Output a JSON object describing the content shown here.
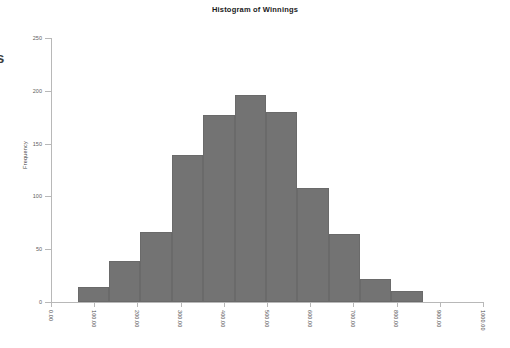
{
  "edge_fragment": {
    "text": "s"
  },
  "chart_data": {
    "type": "bar",
    "title": "Histogram of Winnings",
    "subtitle": "",
    "xlabel": "",
    "ylabel": "Frequency",
    "grid": false,
    "legend": "none",
    "bar_color": "#737373",
    "bar_edge_color": "#6a6a6a",
    "axis_color": "#b8b8b8",
    "xlim": [
      0,
      1000
    ],
    "ylim": [
      0,
      250
    ],
    "x_tick_labels": [
      "0.00",
      "100.00",
      "200.00",
      "300.00",
      "400.00",
      "500.00",
      "600.00",
      "700.00",
      "800.00",
      "900.00",
      "1000.00"
    ],
    "x_tick_values": [
      0,
      100,
      200,
      300,
      400,
      500,
      600,
      700,
      800,
      900,
      1000
    ],
    "y_tick_labels": [
      "0",
      "50",
      "100",
      "150",
      "200",
      "250"
    ],
    "y_tick_values": [
      0,
      50,
      100,
      150,
      200,
      250
    ],
    "bin_edges": [
      62,
      134,
      207,
      280,
      352,
      425,
      498,
      570,
      643,
      716,
      788,
      861,
      934
    ],
    "bin_labels": [
      "62-134",
      "134-207",
      "207-280",
      "280-352",
      "352-425",
      "425-498",
      "498-570",
      "570-643",
      "643-716",
      "716-788",
      "788-861",
      "861-934"
    ],
    "values": [
      14,
      14,
      39,
      66,
      139,
      177,
      196,
      180,
      108,
      64,
      22,
      10
    ]
  }
}
